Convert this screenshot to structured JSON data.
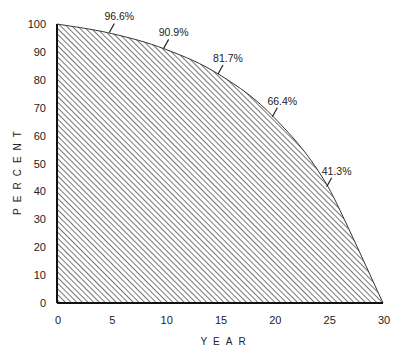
{
  "chart_data": {
    "type": "area",
    "title": "",
    "xlabel": "YEAR",
    "ylabel": "PERCENT",
    "x": [
      0,
      5,
      10,
      15,
      20,
      25,
      30
    ],
    "series": [
      {
        "name": "Percent remaining",
        "values": [
          100,
          96.6,
          90.9,
          81.7,
          66.4,
          41.3,
          0
        ],
        "fill": "diagonal-hatch"
      }
    ],
    "annotations": [
      {
        "x": 5,
        "y": 96.6,
        "text": "96.6%"
      },
      {
        "x": 10,
        "y": 90.9,
        "text": "90.9%"
      },
      {
        "x": 15,
        "y": 81.7,
        "text": "81.7%"
      },
      {
        "x": 20,
        "y": 66.4,
        "text": "66.4%"
      },
      {
        "x": 25,
        "y": 41.3,
        "text": "41.3%"
      }
    ],
    "xticks": [
      0,
      5,
      10,
      15,
      20,
      25,
      30
    ],
    "yticks": [
      0,
      10,
      20,
      30,
      40,
      50,
      60,
      70,
      80,
      90,
      100
    ],
    "xlim": [
      0,
      30
    ],
    "ylim": [
      0,
      100
    ],
    "grid": false,
    "legend": null
  },
  "colors": {
    "ink": "#222222",
    "hatch": "#555555",
    "background": "#ffffff"
  }
}
